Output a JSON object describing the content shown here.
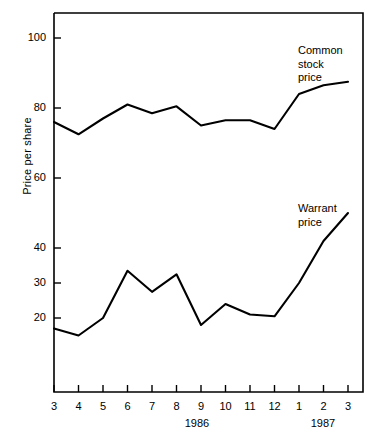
{
  "chart_data": {
    "type": "line",
    "title": "",
    "xlabel": "",
    "ylabel": "Price per share",
    "x": [
      "3",
      "4",
      "5",
      "6",
      "7",
      "8",
      "9",
      "10",
      "11",
      "12",
      "1",
      "2",
      "3"
    ],
    "x_group_labels": [
      "1986",
      "1987"
    ],
    "xlim": [
      0,
      12
    ],
    "ylim": [
      5,
      105
    ],
    "yticks": [
      20,
      30,
      40,
      60,
      80,
      100
    ],
    "ytick_labels": [
      "20",
      "30",
      "40",
      "60",
      "80",
      "100"
    ],
    "grid": false,
    "legend_position": "inline-annotations",
    "series": [
      {
        "name": "Common stock price",
        "annotation": "Common\nstock\nprice",
        "values": [
          76.0,
          72.5,
          77.0,
          81.0,
          78.5,
          80.5,
          75.0,
          76.5,
          76.5,
          74.0,
          84.0,
          86.5,
          87.5
        ]
      },
      {
        "name": "Warrant price",
        "annotation": "Warrant\nprice",
        "values": [
          17.0,
          15.0,
          20.0,
          33.5,
          27.5,
          32.5,
          18.0,
          24.0,
          21.0,
          20.5,
          30.0,
          42.0,
          50.0
        ]
      }
    ],
    "line_color": "#000000",
    "background_color": "#ffffff"
  },
  "axis": {
    "y_title": "Price per share"
  },
  "years": {
    "first": "1986",
    "second": "1987"
  }
}
